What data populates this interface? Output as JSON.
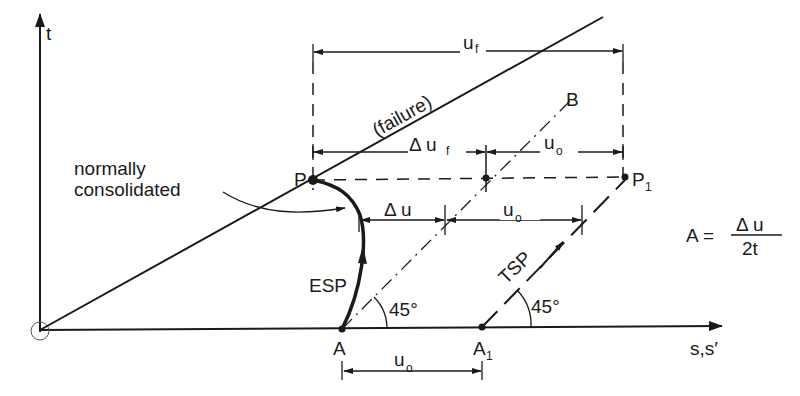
{
  "diagram": {
    "axes": {
      "y_label": "t",
      "x_label": "s,s′"
    },
    "lines": {
      "failure_label": "(failure)"
    },
    "points": {
      "P": "P",
      "P1": "P",
      "P1_sub": "1",
      "A": "A",
      "A1": "A",
      "A1_sub": "1",
      "B": "B"
    },
    "paths": {
      "esp_label": "ESP",
      "tsp_label": "TSP"
    },
    "annotations": {
      "nc_line1": "normally",
      "nc_line2": "consolidated",
      "angle_esp": "45°",
      "angle_tsp": "45°"
    },
    "dimensions": {
      "uf": "u",
      "uf_sub": "f",
      "delta_uf": "Δ u",
      "delta_uf_sub": "f",
      "uo_top": "u",
      "uo_top_sub": "o",
      "delta_u": "Δ u",
      "uo_mid": "u",
      "uo_mid_sub": "o",
      "uo_bottom": "u",
      "uo_bottom_sub": "o"
    },
    "formula": {
      "lhs": "A =",
      "numerator": "Δ u",
      "denominator": "2t"
    }
  }
}
